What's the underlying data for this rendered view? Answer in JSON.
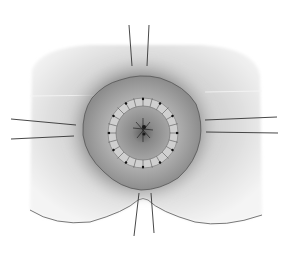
{
  "illustration": {
    "subject": "surgical illustration of perineal region with circular suture ring and four pairs of retraction sutures",
    "colors": {
      "background": "#ffffff",
      "skin": "#d6d6d6",
      "skin_edge": "#ececec",
      "outer_ring": "#8a8a8a",
      "mucosa": "#a9a9a9",
      "inner_ring": "#c8c8c8",
      "lumen": "#8f8f8f",
      "suture": "#3a3a3a"
    },
    "suture_count": 24,
    "retraction_suture_pairs": [
      "top",
      "left",
      "right",
      "bottom"
    ]
  }
}
